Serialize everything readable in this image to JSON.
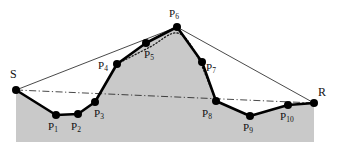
{
  "figure": {
    "width": 340,
    "height": 152,
    "background_color": "#ffffff",
    "terrain_fill_color": "#c9c9c9",
    "terrain_stroke_color": "#000000",
    "thin_line_color": "#1a1a1a",
    "dotted_curve_color": "#1a1a1a",
    "vertex_color": "#000000"
  },
  "chart_data": {
    "type": "line",
    "title": "",
    "xlabel": "",
    "ylabel": "",
    "grid": false,
    "legend": "none",
    "xlim": [
      0,
      340
    ],
    "ylim": [
      152,
      0
    ],
    "series": [
      {
        "name": "terrain-polyline",
        "style": "thick-solid",
        "labels": [
          "S",
          "P1",
          "P2",
          "P3",
          "P4",
          "P5",
          "P6",
          "P7",
          "P8",
          "P9",
          "P10",
          "R"
        ],
        "x": [
          16,
          56,
          78,
          95,
          117,
          146,
          177,
          202,
          216,
          250,
          288,
          314
        ],
        "y": [
          90,
          115,
          114,
          102,
          64,
          43,
          27,
          62,
          101,
          116,
          105,
          103
        ]
      },
      {
        "name": "visibility-line-s-p6",
        "style": "thin-solid",
        "x": [
          16,
          177
        ],
        "y": [
          90,
          27
        ]
      },
      {
        "name": "visibility-line-p6-r",
        "style": "thin-solid",
        "x": [
          177,
          314
        ],
        "y": [
          27,
          103
        ]
      },
      {
        "name": "visibility-line-s-r",
        "style": "thin-dash-dot",
        "x": [
          16,
          314
        ],
        "y": [
          90,
          103
        ]
      },
      {
        "name": "shortcut-curve",
        "style": "dotted",
        "x": [
          117,
          150,
          177,
          196,
          216
        ],
        "y": [
          64,
          47,
          33,
          54,
          101
        ]
      }
    ]
  },
  "vertices": [
    {
      "id": "S",
      "label": "S",
      "subscript": "",
      "x": 16,
      "y": 90,
      "label_x": 10,
      "label_y": 68,
      "marker": true
    },
    {
      "id": "P1",
      "label": "P",
      "subscript": "1",
      "x": 56,
      "y": 115,
      "label_x": 48,
      "label_y": 121,
      "marker": true
    },
    {
      "id": "P2",
      "label": "P",
      "subscript": "2",
      "x": 78,
      "y": 114,
      "label_x": 71,
      "label_y": 121,
      "marker": true
    },
    {
      "id": "P3",
      "label": "P",
      "subscript": "3",
      "x": 95,
      "y": 102,
      "label_x": 94,
      "label_y": 108,
      "marker": true
    },
    {
      "id": "P4",
      "label": "P",
      "subscript": "4",
      "x": 117,
      "y": 64,
      "label_x": 98,
      "label_y": 60,
      "marker": true
    },
    {
      "id": "P5",
      "label": "P",
      "subscript": "5",
      "x": 146,
      "y": 43,
      "label_x": 144,
      "label_y": 49,
      "marker": true
    },
    {
      "id": "P6",
      "label": "P",
      "subscript": "6",
      "x": 177,
      "y": 27,
      "label_x": 169,
      "label_y": 8,
      "marker": true
    },
    {
      "id": "P7",
      "label": "P",
      "subscript": "7",
      "x": 202,
      "y": 62,
      "label_x": 206,
      "label_y": 62,
      "marker": true
    },
    {
      "id": "P8",
      "label": "P",
      "subscript": "8",
      "x": 216,
      "y": 101,
      "label_x": 202,
      "label_y": 108,
      "marker": true
    },
    {
      "id": "P9",
      "label": "P",
      "subscript": "9",
      "x": 250,
      "y": 116,
      "label_x": 243,
      "label_y": 122,
      "marker": true
    },
    {
      "id": "P10",
      "label": "P",
      "subscript": "10",
      "x": 288,
      "y": 105,
      "label_x": 280,
      "label_y": 111,
      "marker": true
    },
    {
      "id": "R",
      "label": "R",
      "subscript": "",
      "x": 314,
      "y": 103,
      "label_x": 318,
      "label_y": 86,
      "marker": true
    }
  ]
}
